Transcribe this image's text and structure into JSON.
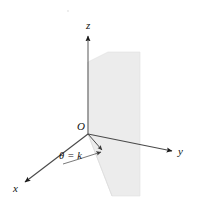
{
  "figure": {
    "background_color": "#ffffff",
    "width": 197,
    "height": 205
  },
  "labels": {
    "z_axis": "z",
    "y_axis": "y",
    "x_axis": "x",
    "origin": "O",
    "plane_equation": "θ = k"
  },
  "colors": {
    "axis_line": "#555555",
    "axis_dark": "#1a1a1a",
    "plane_fill": "#ececec",
    "plane_edge": "#d4d4d4",
    "text": "#111111"
  },
  "geometry": {
    "origin": {
      "x": 88,
      "y": 134
    },
    "z_axis_tip": {
      "x": 88,
      "y": 34
    },
    "y_axis_tip": {
      "x": 176,
      "y": 152
    },
    "x_axis_tip": {
      "x": 22,
      "y": 184
    },
    "ray_tip": {
      "x": 105,
      "y": 152
    },
    "arc_label_anchor": {
      "x": 59,
      "y": 151
    }
  },
  "elements": {
    "z_axis_name": "z-axis",
    "y_axis_name": "y-axis",
    "x_axis_name": "x-axis",
    "plane_name": "theta-equals-k-plane",
    "ray_name": "theta-ray",
    "arc_name": "theta-angle-arc",
    "origin_name": "origin-point"
  }
}
